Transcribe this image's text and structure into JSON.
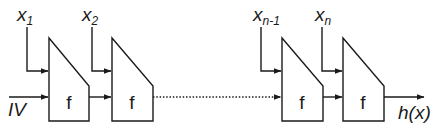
{
  "diagram": {
    "type": "iterated-hash-chain",
    "inputs": [
      {
        "base": "x",
        "sub": "1"
      },
      {
        "base": "x",
        "sub": "2"
      },
      {
        "base": "x",
        "sub": "n-1"
      },
      {
        "base": "x",
        "sub": "n"
      }
    ],
    "initial_value": "IV",
    "function_label": "f",
    "output": "h(x)",
    "blocks": [
      {
        "label": "f",
        "input": "x1"
      },
      {
        "label": "f",
        "input": "x2"
      },
      {
        "label": "f",
        "input": "xn-1"
      },
      {
        "label": "f",
        "input": "xn"
      }
    ],
    "ellipsis_connection": "dotted"
  }
}
